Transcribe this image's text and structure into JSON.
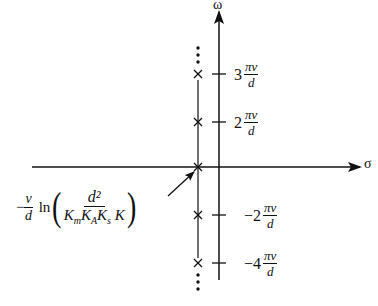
{
  "diagram": {
    "type": "s-plane pole plot",
    "axes": {
      "real_axis_label": "σ",
      "imag_axis_label": "ω"
    },
    "tick_labels": [
      {
        "coef": "3",
        "num": "πv",
        "den": "d"
      },
      {
        "coef": "2",
        "num": "πv",
        "den": "d"
      },
      {
        "coef": "−2",
        "num": "πv",
        "den": "d"
      },
      {
        "coef": "−4",
        "num": "πv",
        "den": "d"
      }
    ],
    "pole_marker": "×",
    "continuation": "⋮",
    "annotation": {
      "prefix_sign": "−",
      "prefix_num": "v",
      "prefix_den": "d",
      "func": "ln",
      "inner_num": "d²",
      "inner_den": "KmKAKsK",
      "inner_den_parts": [
        "K",
        "m",
        "K",
        "A",
        "K",
        "s",
        "K"
      ]
    },
    "colors": {
      "ink": "#111111",
      "background": "#ffffff"
    }
  }
}
